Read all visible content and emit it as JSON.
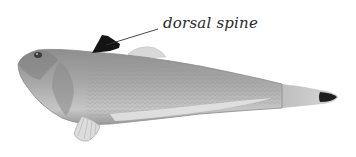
{
  "figure": {
    "annotation": {
      "label": "dorsal spine",
      "points_to": "dorsal-spine"
    }
  },
  "colors": {
    "background": "#ffffff",
    "body": "#a9a9a9",
    "body_dark": "#7d7d7d",
    "belly": "#d2d2d2",
    "spine": "#141414",
    "tail_tip": "#1e1e1e",
    "leader_line": "#333333",
    "label_text": "#2a2a2a"
  }
}
